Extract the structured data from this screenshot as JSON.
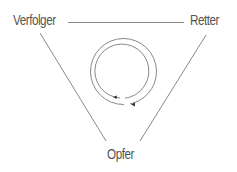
{
  "diagram": {
    "type": "drama-triangle",
    "nodes": [
      {
        "id": "persecutor",
        "label": "Verfolger",
        "position": "top-left"
      },
      {
        "id": "rescuer",
        "label": "Retter",
        "position": "top-right"
      },
      {
        "id": "victim",
        "label": "Opfer",
        "position": "bottom"
      }
    ],
    "edges": [
      {
        "from": "persecutor",
        "to": "rescuer"
      },
      {
        "from": "persecutor",
        "to": "victim"
      },
      {
        "from": "rescuer",
        "to": "victim"
      }
    ],
    "center": {
      "icon": "cycle-arrows-icon",
      "description": "two concentric circular arrows indicating a repeating cycle"
    },
    "colors": {
      "line": "#6a6a6a",
      "text": "#555555",
      "background": "#ffffff"
    }
  }
}
